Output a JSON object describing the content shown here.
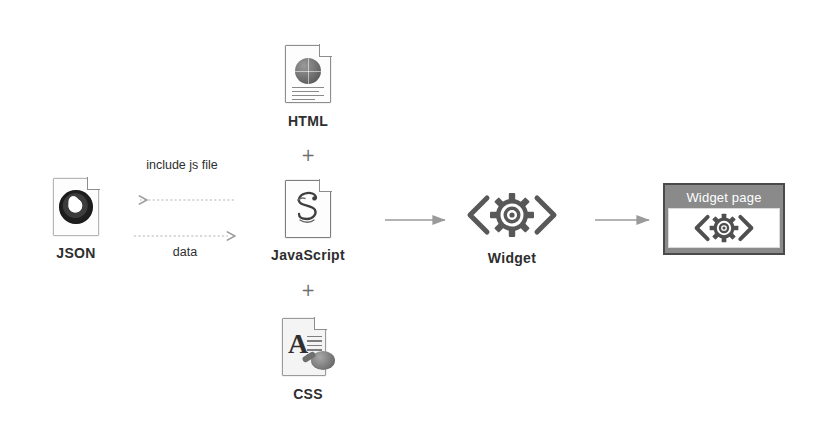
{
  "diagram": {
    "background_color": "#ffffff",
    "nodes": {
      "json": {
        "label": "JSON",
        "icon": "json-file-icon"
      },
      "html": {
        "label": "HTML",
        "icon": "html-file-icon"
      },
      "javascript": {
        "label": "JavaScript",
        "icon": "javascript-file-icon"
      },
      "css": {
        "label": "CSS",
        "icon": "css-file-icon"
      },
      "widget": {
        "label": "Widget",
        "icon": "widget-gear-icon",
        "glyph_left": "‹",
        "glyph_right": "›"
      },
      "widget_page": {
        "title": "Widget page",
        "icon": "widget-gear-icon",
        "glyph_left": "‹",
        "glyph_right": "›",
        "titlebar_color": "#8a8a8a",
        "border_color": "#4a4a4a",
        "canvas_color": "#ffffff"
      }
    },
    "separators": {
      "plus_html_js": "+",
      "plus_js_css": "+"
    },
    "edges": {
      "include_js_file": {
        "label": "include js file",
        "style": "dashed",
        "direction": "right-to-left",
        "from": "javascript",
        "to": "json"
      },
      "data": {
        "label": "data",
        "style": "dashed",
        "direction": "left-to-right",
        "from": "json",
        "to": "javascript"
      },
      "js_to_widget": {
        "label": "",
        "style": "solid",
        "direction": "left-to-right",
        "from": "javascript",
        "to": "widget"
      },
      "widget_to_page": {
        "label": "",
        "style": "solid",
        "direction": "left-to-right",
        "from": "widget",
        "to": "widget_page"
      }
    },
    "colors": {
      "stroke": "#9a9a9a",
      "text": "#2e2e2e",
      "icon_gray": "#6f6f6f"
    }
  }
}
